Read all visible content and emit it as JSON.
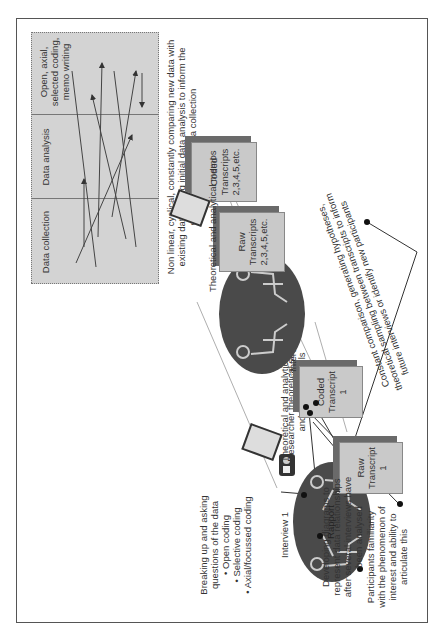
{
  "process_panel": {
    "columns": [
      "Data collection",
      "Data analysis",
      "Open, axial, selected coding, memo writing"
    ],
    "caption": "Non linear, cyclical, constantly comparing new data with existing data, using initial data analysis to inform the direction of future data collection"
  },
  "interview1": {
    "label": "Interview 1",
    "center_text": "Rapport",
    "researcher_note": "Researcher theoretical sensitivity and interview skills",
    "participant_note": "Participants familiarity with the phenomenon of interest and ability to articulate this"
  },
  "interview2": {
    "label": "Interview 2,3,4, 5 etc"
  },
  "documents": {
    "raw1": {
      "line1": "Raw",
      "line2": "Transcript",
      "line3": "1"
    },
    "coded1": {
      "line1": "Coded",
      "line2": "Transcript",
      "line3": "1"
    },
    "raw2": {
      "line1": "Raw",
      "line2": "Transcripts",
      "line3": "2,3,4,5,etc."
    },
    "coded2": {
      "line1": "Coded",
      "line2": "Transcripts",
      "line3": "2,3,4,5,etc."
    }
  },
  "memos": {
    "memo1": "Theoretical and analytical memos",
    "memo2": "Theoretical and analytical memos"
  },
  "coding_note": {
    "intro": "Breaking up and asking questions of the data",
    "items": [
      "• Open coding",
      "• Selective coding",
      "• Axial/focussed coding"
    ]
  },
  "diagram_note": "Developing diagrams to represent data relationships after several interviews have been analysed",
  "comparison_note": "Constant comparison, generating hypotheses, theoretical sampling between transcripts to inform future interviews or identify new participants",
  "colors": {
    "doc_fill": "#c9c9c9",
    "doc_shadow": "#6a6a6a",
    "oval": "#4a4a4a",
    "panel": "#d3d3d3",
    "border": "#555555"
  }
}
